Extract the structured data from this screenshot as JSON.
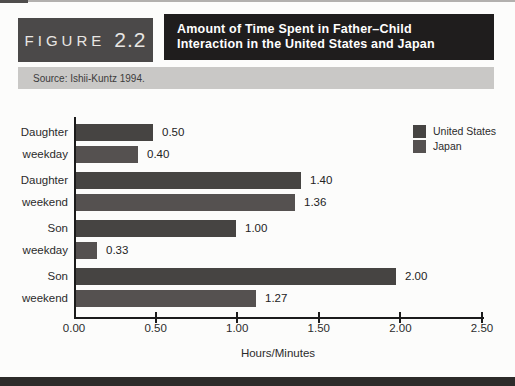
{
  "header": {
    "figure_label": "FIGURE",
    "figure_number": "2.2",
    "title_line1": "Amount of Time Spent in Father–Child",
    "title_line2": "Interaction in the United States and Japan",
    "source": "Source: Ishii-Kuntz 1994."
  },
  "chart_data": {
    "type": "bar",
    "orientation": "horizontal",
    "title": "Amount of Time Spent in Father–Child Interaction in the United States and Japan",
    "xlabel": "Hours/Minutes",
    "xlim": [
      0,
      2.5
    ],
    "grid": false,
    "legend_position": "top-right",
    "categories": [
      "Daughter weekday",
      "Daughter weekend",
      "Son weekday",
      "Son weekend"
    ],
    "category_lines": [
      [
        "Daughter",
        "weekday"
      ],
      [
        "Daughter",
        "weekend"
      ],
      [
        "Son",
        "weekday"
      ],
      [
        "Son",
        "weekend"
      ]
    ],
    "xticks": [
      {
        "v": 0.0,
        "label": "0.00"
      },
      {
        "v": 0.5,
        "label": "0.50"
      },
      {
        "v": 1.0,
        "label": "1.00"
      },
      {
        "v": 1.5,
        "label": "1.50"
      },
      {
        "v": 2.0,
        "label": "2.00"
      },
      {
        "v": 2.5,
        "label": "2.50"
      }
    ],
    "series": [
      {
        "name": "United States",
        "color": "#464442",
        "values": [
          0.5,
          1.4,
          1.0,
          2.0
        ],
        "labels": [
          "0.50",
          "1.40",
          "1.00",
          "2.00"
        ],
        "drawn": [
          0.47,
          1.38,
          0.98,
          1.96
        ]
      },
      {
        "name": "Japan",
        "color": "#555150",
        "values": [
          0.4,
          1.36,
          0.33,
          1.27
        ],
        "labels": [
          "0.40",
          "1.36",
          "0.33",
          "1.27"
        ],
        "drawn": [
          0.38,
          1.34,
          0.13,
          1.1
        ]
      }
    ],
    "note": "Japan bars for 0.33 and 1.27 are drawn shorter than labeled values in the source scan; 'drawn' holds the depicted lengths."
  },
  "colors": {
    "page-bg": "#fcfcfb",
    "accent-dark": "#1f1d1d",
    "figure-box": "#4b4949",
    "source-band": "#c9c8c6",
    "axis": "#1b1b1b",
    "text": "#2b2b2b",
    "bottom-rule": "#2d2b2a"
  }
}
